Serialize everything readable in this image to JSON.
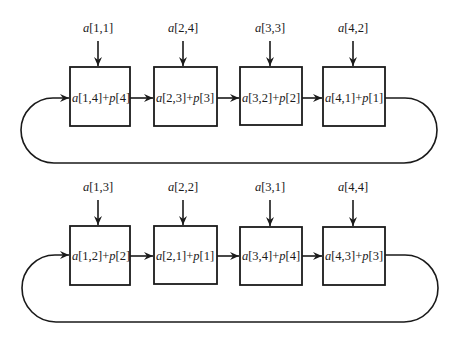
{
  "diagram": {
    "type": "ring-pipeline",
    "rows": [
      {
        "name": "row-1",
        "inputs": [
          {
            "var": "a",
            "idx": "[1,1]"
          },
          {
            "var": "a",
            "idx": "[2,4]"
          },
          {
            "var": "a",
            "idx": "[3,3]"
          },
          {
            "var": "a",
            "idx": "[4,2]"
          }
        ],
        "boxes": [
          {
            "a": "a",
            "ai": "[1,4]",
            "op": "+",
            "p": "p",
            "pi": "[4]"
          },
          {
            "a": "a",
            "ai": "[2,3]",
            "op": "+",
            "p": "p",
            "pi": "[3]"
          },
          {
            "a": "a",
            "ai": "[3,2]",
            "op": "+",
            "p": "p",
            "pi": "[2]"
          },
          {
            "a": "a",
            "ai": "[4,1]",
            "op": "+",
            "p": "p",
            "pi": "[1]"
          }
        ]
      },
      {
        "name": "row-2",
        "inputs": [
          {
            "var": "a",
            "idx": "[1,3]"
          },
          {
            "var": "a",
            "idx": "[2,2]"
          },
          {
            "var": "a",
            "idx": "[3,1]"
          },
          {
            "var": "a",
            "idx": "[4,4]"
          }
        ],
        "boxes": [
          {
            "a": "a",
            "ai": "[1,2]",
            "op": "+",
            "p": "p",
            "pi": "[2]"
          },
          {
            "a": "a",
            "ai": "[2,1]",
            "op": "+",
            "p": "p",
            "pi": "[1]"
          },
          {
            "a": "a",
            "ai": "[3,4]",
            "op": "+",
            "p": "p",
            "pi": "[4]"
          },
          {
            "a": "a",
            "ai": "[4,3]",
            "op": "+",
            "p": "p",
            "pi": "[3]"
          }
        ]
      }
    ],
    "colors": {
      "stroke": "#1a1a1a",
      "background": "#ffffff"
    }
  }
}
